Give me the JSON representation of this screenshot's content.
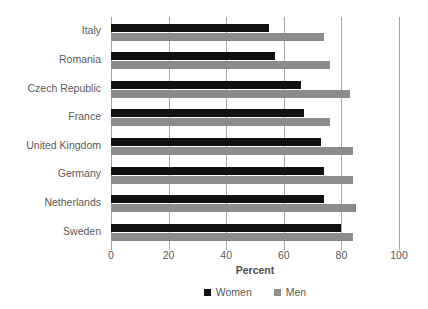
{
  "chart_data": {
    "type": "bar",
    "orientation": "horizontal",
    "title": "",
    "xlabel": "Percent",
    "ylabel": "",
    "xlim": [
      0,
      100
    ],
    "xticks": [
      0,
      20,
      40,
      60,
      80,
      100
    ],
    "grid": true,
    "legend_position": "bottom-center",
    "categories": [
      "Italy",
      "Romania",
      "Czech Republic",
      "France",
      "United Kingdom",
      "Germany",
      "Netherlands",
      "Sweden"
    ],
    "series": [
      {
        "name": "Women",
        "color": "#111111",
        "values": [
          55,
          57,
          66,
          67,
          73,
          74,
          74,
          80
        ]
      },
      {
        "name": "Men",
        "color": "#8c8c8c",
        "values": [
          74,
          76,
          83,
          76,
          84,
          84,
          85,
          84
        ]
      }
    ]
  },
  "legend": {
    "items": [
      {
        "label": "Women",
        "swatch": "black-square-icon"
      },
      {
        "label": "Men",
        "swatch": "gray-square-icon"
      }
    ]
  },
  "colors": {
    "women": "#111111",
    "men": "#8c8c8c",
    "axis": "#a6a6a6",
    "text": "#595959",
    "background": "#ffffff"
  }
}
